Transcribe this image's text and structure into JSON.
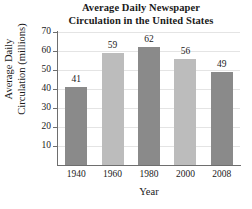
{
  "chart_data": {
    "type": "bar",
    "title": "Average Daily Newspaper Circulation in the United States",
    "title_lines": [
      "Average Daily Newspaper",
      "Circulation in the United States"
    ],
    "xlabel": "Year",
    "ylabel": "Average Daily Circulation (millions)",
    "ylabel_lines": [
      "Average Daily",
      "Circulation (millions)"
    ],
    "categories": [
      "1940",
      "1960",
      "1980",
      "2000",
      "2008"
    ],
    "values": [
      41,
      59,
      62,
      56,
      49
    ],
    "value_labels": [
      "41",
      "59",
      "62",
      "56",
      "49"
    ],
    "ylim": [
      0,
      70
    ],
    "yticks": [
      70,
      60,
      50,
      40,
      30,
      20,
      10
    ],
    "ytick_labels": [
      "70",
      "60",
      "50",
      "40",
      "30",
      "20",
      "10"
    ],
    "grid": true,
    "legend": "none",
    "bar_colors": [
      "#8a8a8a",
      "#bcbcbc",
      "#8a8a8a",
      "#bcbcbc",
      "#8a8a8a"
    ],
    "colors": {
      "bar_dark": "#8a8a8a",
      "bar_light": "#bcbcbc",
      "axis": "#6e6e6e",
      "grid": "#e4e4e4",
      "text": "#1a1a1a",
      "background": "#ffffff"
    }
  }
}
